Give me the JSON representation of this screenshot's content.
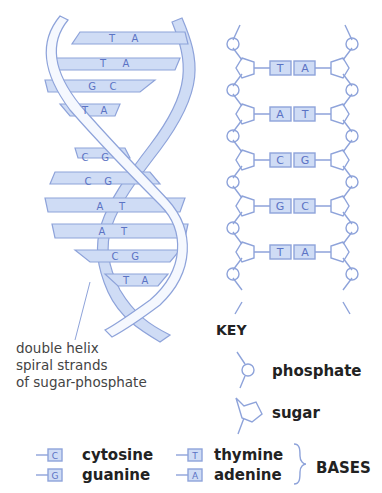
{
  "colors": {
    "fill": "#cfdcf5",
    "stroke": "#7f98d6",
    "letter": "#5b73c4",
    "text": "#222222"
  },
  "helix": {
    "base_pairs": [
      {
        "left": "T",
        "right": "A"
      },
      {
        "left": "T",
        "right": "A"
      },
      {
        "left": "G",
        "right": "C"
      },
      {
        "left": "T",
        "right": "A"
      },
      {
        "left": "C",
        "right": "G"
      },
      {
        "left": "C",
        "right": "G"
      },
      {
        "left": "A",
        "right": "T"
      },
      {
        "left": "A",
        "right": "T"
      },
      {
        "left": "C",
        "right": "G"
      },
      {
        "left": "T",
        "right": "A"
      }
    ],
    "caption": [
      "double helix",
      "spiral strands",
      "of sugar-phosphate"
    ]
  },
  "ladder": {
    "base_pairs": [
      {
        "left": "T",
        "right": "A"
      },
      {
        "left": "A",
        "right": "T"
      },
      {
        "left": "C",
        "right": "G"
      },
      {
        "left": "G",
        "right": "C"
      },
      {
        "left": "T",
        "right": "A"
      }
    ]
  },
  "key": {
    "title": "KEY",
    "phosphate": "phosphate",
    "sugar": "sugar",
    "bases_label": "BASES",
    "bases": [
      {
        "letter": "C",
        "name": "cytosine"
      },
      {
        "letter": "G",
        "name": "guanine"
      },
      {
        "letter": "T",
        "name": "thymine"
      },
      {
        "letter": "A",
        "name": "adenine"
      }
    ]
  }
}
